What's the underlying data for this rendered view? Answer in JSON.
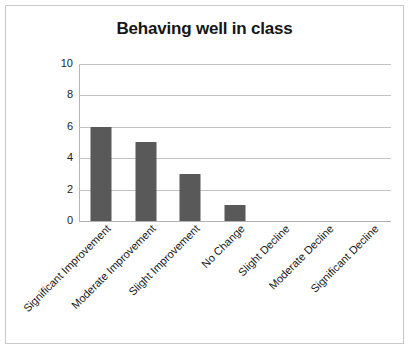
{
  "chart_data": {
    "type": "bar",
    "title": "Behaving well in class",
    "xlabel": "",
    "ylabel": "",
    "ylim": [
      0,
      10
    ],
    "yticks": [
      0,
      2,
      4,
      6,
      8,
      10
    ],
    "grid": true,
    "legend": "none",
    "categories": [
      "Significant Improvement",
      "Moderate Improvement",
      "Slight Improvement",
      "No Change",
      "Slight Decline",
      "Moderate Decline",
      "Significant Decline"
    ],
    "values": [
      6,
      5,
      3,
      1,
      0,
      0,
      0
    ],
    "bar_color": "#595959",
    "gridline_color": "#c3c3c3",
    "axis_color": "#b5b5b5",
    "background_color": "#ffffff",
    "border_color": "#c9c9c9",
    "label_rotation_degrees": -45
  }
}
